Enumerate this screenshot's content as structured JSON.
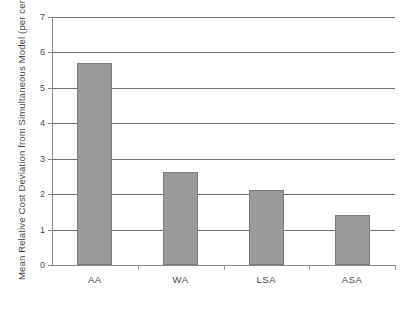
{
  "chart_data": {
    "type": "bar",
    "title": "",
    "subtitle": "",
    "xlabel": "",
    "ylabel": "Mean Relative Cost Deviation from Simultaneous Model (per cent)",
    "categories": [
      "AA",
      "WA",
      "LSA",
      "ASA"
    ],
    "values": [
      5.7,
      2.63,
      2.12,
      1.42
    ],
    "series": [
      {
        "name": "Mean Relative Cost Deviation",
        "values": [
          5.7,
          2.63,
          2.12,
          1.42
        ]
      }
    ],
    "ylim": [
      0,
      7
    ],
    "y_ticks": [
      0,
      1,
      2,
      3,
      4,
      5,
      6,
      7
    ],
    "y_tick_labels": [
      "0",
      "1",
      "2",
      "3",
      "4",
      "5",
      "6",
      "7"
    ],
    "grid": true,
    "grid_axis": "y",
    "legend": false,
    "legend_position": "none",
    "annotations": [],
    "colors": {
      "bar_fill": "#9a9a9a",
      "bar_border": "#7c7c7c",
      "gridline": "#6d6d6d",
      "axis": "#8a8a8a",
      "text": "#4a4a4a",
      "background": "#ffffff"
    }
  }
}
